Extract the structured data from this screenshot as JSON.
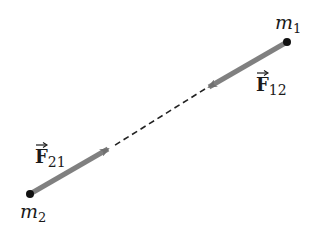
{
  "diagram": {
    "masses": [
      {
        "id": "m1",
        "label": "m",
        "subscript": "1",
        "x": 287,
        "y": 42
      },
      {
        "id": "m2",
        "label": "m",
        "subscript": "2",
        "x": 30,
        "y": 194
      }
    ],
    "forces": [
      {
        "id": "F12",
        "label": "F",
        "subscript": "12",
        "from": [
          287,
          42
        ],
        "to": [
          207,
          88
        ]
      },
      {
        "id": "F21",
        "label": "F",
        "subscript": "21",
        "from": [
          30,
          194
        ],
        "to": [
          110,
          148
        ]
      }
    ],
    "dashed_line": {
      "from": [
        207,
        88
      ],
      "to": [
        110,
        148
      ]
    },
    "colors": {
      "arrow": "#808080",
      "arrow_head": "#6e6e6e",
      "dot": "#111111",
      "dash": "#222222",
      "text": "#1a1a1a"
    }
  }
}
